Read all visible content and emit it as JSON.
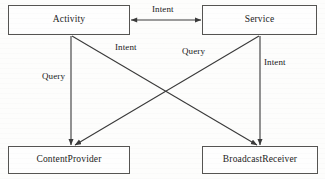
{
  "diagram": {
    "type": "node-edge",
    "colors": {
      "background": "#fdfdfc",
      "box_border": "#555452",
      "box_fill": "#fefefe",
      "edge_stroke": "#3a3a3a",
      "text": "#1b1b1b"
    },
    "nodes": [
      {
        "id": "activity",
        "label": "Activity"
      },
      {
        "id": "service",
        "label": "Service"
      },
      {
        "id": "contentprovider",
        "label": "ContentProvider"
      },
      {
        "id": "broadcastreceiver",
        "label": "BroadcastReceiver"
      }
    ],
    "edges": [
      {
        "id": "activity-service",
        "from": "Activity",
        "to": "Service",
        "label": "Intent",
        "arrow": "both"
      },
      {
        "id": "activity-contentprovider",
        "from": "Activity",
        "to": "ContentProvider",
        "label": "Query",
        "arrow": "to"
      },
      {
        "id": "activity-broadcastreceiver",
        "from": "Activity",
        "to": "BroadcastReceiver",
        "label": "Intent",
        "arrow": "to"
      },
      {
        "id": "service-contentprovider",
        "from": "Service",
        "to": "ContentProvider",
        "label": "Query",
        "arrow": "to"
      },
      {
        "id": "service-broadcastreceiver",
        "from": "Service",
        "to": "BroadcastReceiver",
        "label": "Intent",
        "arrow": "to"
      }
    ]
  }
}
